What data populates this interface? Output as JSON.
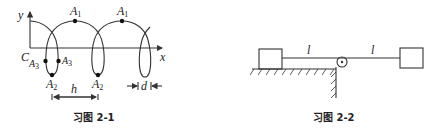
{
  "figures": [
    {
      "id": "fig-2-1",
      "caption": "习图 2-1",
      "axes": {
        "x_label": "x",
        "y_label": "y"
      },
      "points": {
        "C": "C",
        "A1": "A",
        "A1_sub": "1",
        "A2": "A",
        "A2_sub": "2",
        "A3": "A",
        "A3_sub": "3"
      },
      "dimensions": {
        "h": "h",
        "d": "d"
      }
    },
    {
      "id": "fig-2-2",
      "caption": "习图 2-2",
      "labels": {
        "l_left": "l",
        "l_right": "l"
      }
    }
  ]
}
